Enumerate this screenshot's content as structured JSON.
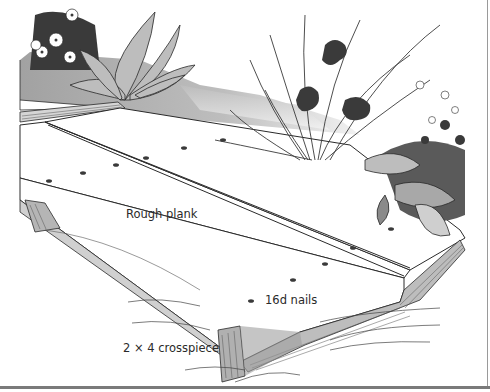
{
  "figure": {
    "labels": {
      "plank": "Rough plank",
      "nails": "16d nails",
      "crosspiece": "2 × 4 crosspiece"
    },
    "colors": {
      "ink": "#2a2a2a",
      "shade_dark": "#3a3a3a",
      "shade_mid": "#8a8a8a",
      "shade_light": "#c8c8c8",
      "paper": "#ffffff"
    }
  }
}
